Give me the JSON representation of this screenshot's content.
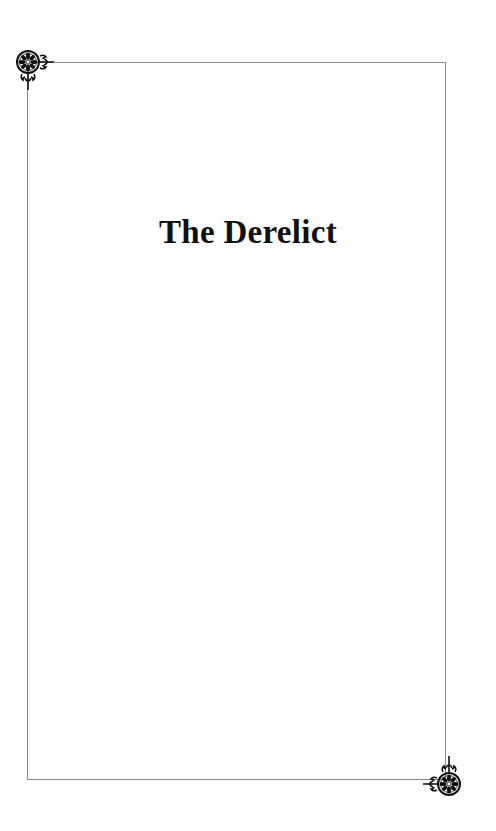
{
  "page": {
    "title": "The Derelict",
    "border_color": "#8a8a8a",
    "ornaments": [
      "rosette-corner-ornament-top-left",
      "rosette-corner-ornament-bottom-right"
    ]
  }
}
